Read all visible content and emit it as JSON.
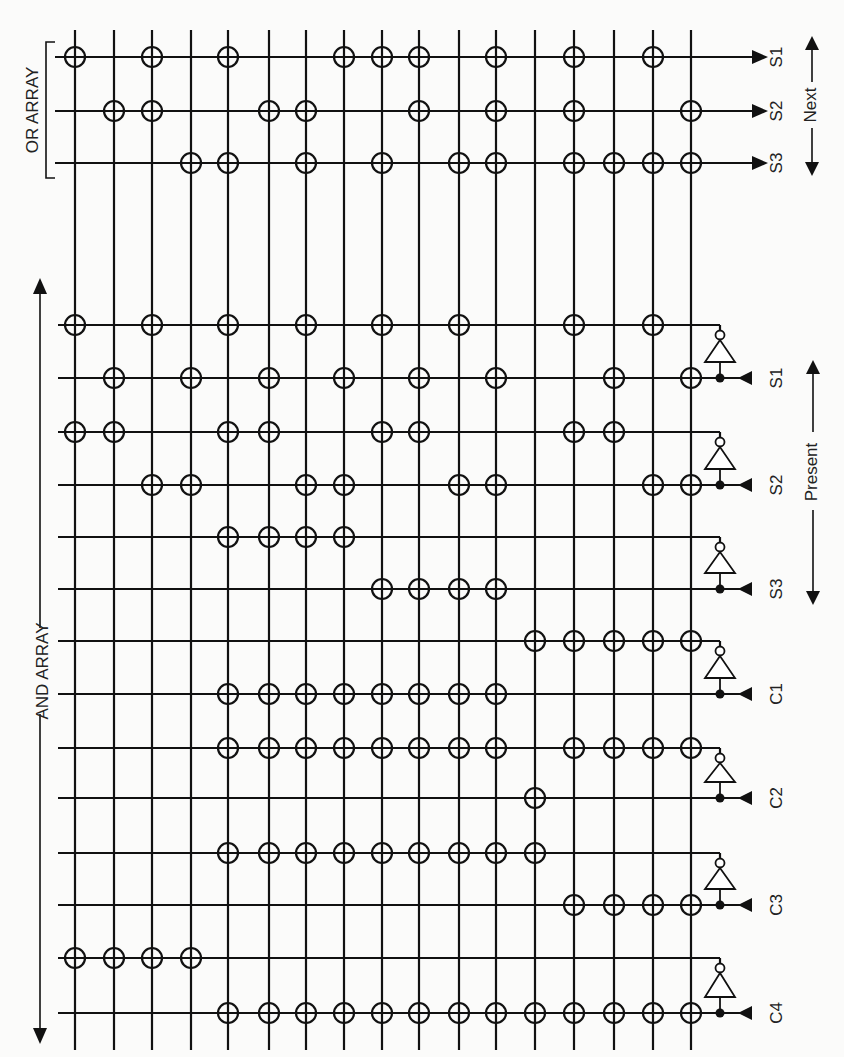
{
  "title_or": "OR ARRAY",
  "title_and": "AND ARRAY",
  "next_label": "Next",
  "present_label": "Present",
  "colors": {
    "ink": "#111111",
    "paper": "#fbfbfa"
  },
  "columns_x": [
    75,
    114,
    152,
    191,
    228,
    269,
    306,
    344,
    382,
    419,
    459,
    496,
    535,
    574,
    614,
    653,
    691
  ],
  "or_rows": [
    {
      "label": "S1",
      "y": 57,
      "crosspoints": [
        0,
        2,
        4,
        7,
        8,
        9,
        11,
        13,
        15
      ]
    },
    {
      "label": "S2",
      "y": 111,
      "crosspoints": [
        1,
        2,
        5,
        6,
        9,
        11,
        13,
        16
      ]
    },
    {
      "label": "S3",
      "y": 163,
      "crosspoints": [
        3,
        4,
        6,
        8,
        10,
        11,
        13,
        14,
        15,
        16
      ]
    }
  ],
  "and_inputs": [
    {
      "label": "S1",
      "inv_y": 325,
      "true_y": 378,
      "inv_crosspoints": [
        0,
        2,
        4,
        6,
        8,
        10,
        13,
        15
      ],
      "true_crosspoints": [
        1,
        3,
        5,
        7,
        9,
        11,
        14,
        16
      ]
    },
    {
      "label": "S2",
      "inv_y": 432,
      "true_y": 485,
      "inv_crosspoints": [
        0,
        1,
        4,
        5,
        8,
        9,
        13,
        14
      ],
      "true_crosspoints": [
        2,
        3,
        6,
        7,
        10,
        11,
        15,
        16
      ]
    },
    {
      "label": "S3",
      "inv_y": 537,
      "true_y": 589,
      "inv_crosspoints": [
        4,
        5,
        6,
        7
      ],
      "true_crosspoints": [
        8,
        9,
        10,
        11
      ]
    },
    {
      "label": "C1",
      "inv_y": 641,
      "true_y": 694,
      "inv_crosspoints": [
        12,
        13,
        14,
        15,
        16
      ],
      "true_crosspoints": [
        4,
        5,
        6,
        7,
        8,
        9,
        10,
        11
      ]
    },
    {
      "label": "C2",
      "inv_y": 748,
      "true_y": 798,
      "inv_crosspoints": [
        4,
        5,
        6,
        7,
        8,
        9,
        10,
        11,
        13,
        14,
        15,
        16
      ],
      "true_crosspoints": [
        12
      ]
    },
    {
      "label": "C3",
      "inv_y": 853,
      "true_y": 905,
      "inv_crosspoints": [
        4,
        5,
        6,
        7,
        8,
        9,
        10,
        11,
        12
      ],
      "true_crosspoints": [
        13,
        14,
        15,
        16
      ]
    },
    {
      "label": "C4",
      "inv_y": 958,
      "true_y": 1013,
      "inv_crosspoints": [
        0,
        1,
        2,
        3
      ],
      "true_crosspoints": [
        4,
        5,
        6,
        7,
        8,
        9,
        10,
        11,
        12,
        13,
        14,
        15,
        16
      ]
    }
  ]
}
